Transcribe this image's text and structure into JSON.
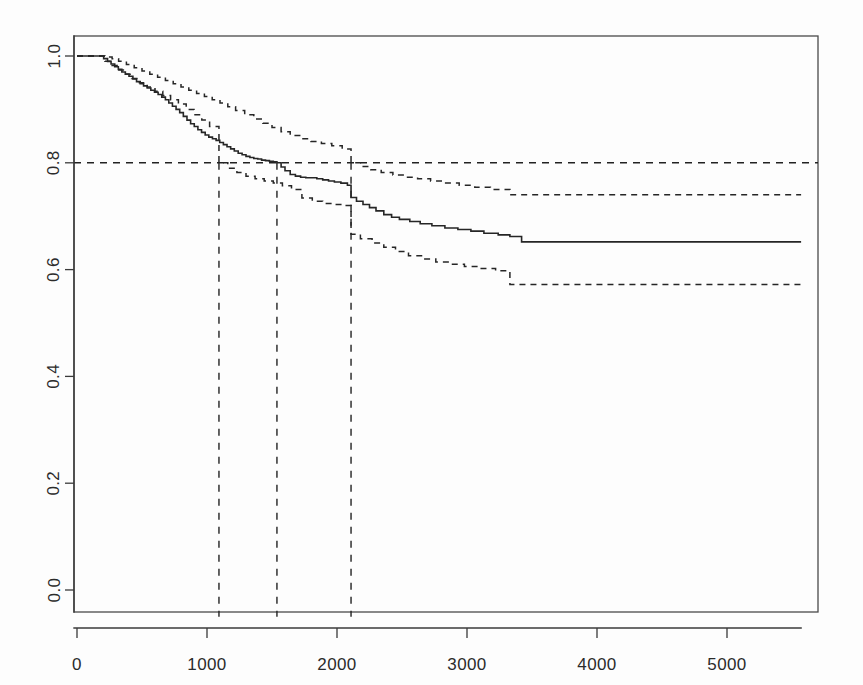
{
  "figure": {
    "kind": "kaplan-meier-survival-plot",
    "background_color": "#fdfdfd",
    "ink_color": "#262626"
  },
  "chart_data": {
    "type": "line",
    "title": "",
    "subtitle": "",
    "xlabel": "",
    "ylabel": "",
    "xlim": [
      -140,
      5720
    ],
    "ylim": [
      -0.05,
      1.05
    ],
    "grid": false,
    "legend": null,
    "xticks": [
      0,
      1000,
      2000,
      3000,
      4000,
      5000
    ],
    "xtick_labels": [
      "0",
      "1000",
      "2000",
      "3000",
      "4000",
      "5000"
    ],
    "yticks": [
      0.0,
      0.2,
      0.4,
      0.6,
      0.8,
      1.0
    ],
    "ytick_labels": [
      "0.0",
      "0.2",
      "0.4",
      "0.6",
      "0.8",
      "1.0"
    ],
    "ytick_label_rotation": -90,
    "annotations": [
      {
        "name": "reference-survival-level",
        "type": "hline",
        "y": 0.8,
        "style": "dashed"
      },
      {
        "name": "lower-ci-crosses-0.8",
        "type": "vline",
        "x": 1092,
        "style": "dashed",
        "from_y": -0.05,
        "to_y": 0.8
      },
      {
        "name": "estimate-crosses-0.8",
        "type": "vline",
        "x": 1538,
        "style": "dashed",
        "from_y": -0.05,
        "to_y": 0.8
      },
      {
        "name": "upper-ci-crosses-0.8",
        "type": "vline",
        "x": 2108,
        "style": "dashed",
        "from_y": -0.05,
        "to_y": 0.8
      }
    ],
    "series": [
      {
        "name": "Survival estimate",
        "style": "solid",
        "step": "post",
        "x": [
          0,
          175,
          205,
          235,
          262,
          290,
          318,
          345,
          372,
          400,
          430,
          458,
          486,
          512,
          540,
          568,
          596,
          624,
          652,
          680,
          706,
          734,
          762,
          790,
          818,
          846,
          874,
          902,
          930,
          958,
          986,
          1014,
          1042,
          1070,
          1098,
          1126,
          1154,
          1182,
          1210,
          1240,
          1270,
          1300,
          1330,
          1360,
          1390,
          1420,
          1450,
          1480,
          1510,
          1538,
          1570,
          1600,
          1640,
          1680,
          1720,
          1760,
          1800,
          1845,
          1890,
          1935,
          1980,
          2030,
          2080,
          2108,
          2150,
          2200,
          2250,
          2300,
          2360,
          2420,
          2480,
          2560,
          2640,
          2730,
          2830,
          2930,
          3030,
          3130,
          3240,
          3330,
          3420,
          5570
        ],
        "y": [
          1.0,
          1.0,
          0.995,
          0.99,
          0.985,
          0.98,
          0.975,
          0.97,
          0.966,
          0.962,
          0.957,
          0.952,
          0.948,
          0.944,
          0.94,
          0.936,
          0.932,
          0.928,
          0.923,
          0.918,
          0.912,
          0.906,
          0.9,
          0.894,
          0.887,
          0.88,
          0.873,
          0.868,
          0.862,
          0.857,
          0.852,
          0.848,
          0.845,
          0.842,
          0.838,
          0.834,
          0.83,
          0.826,
          0.822,
          0.818,
          0.815,
          0.812,
          0.81,
          0.808,
          0.807,
          0.805,
          0.804,
          0.803,
          0.802,
          0.8,
          0.792,
          0.785,
          0.778,
          0.775,
          0.773,
          0.772,
          0.772,
          0.77,
          0.768,
          0.766,
          0.764,
          0.762,
          0.758,
          0.735,
          0.728,
          0.722,
          0.716,
          0.71,
          0.703,
          0.698,
          0.694,
          0.69,
          0.686,
          0.682,
          0.678,
          0.675,
          0.672,
          0.668,
          0.665,
          0.662,
          0.652,
          0.652
        ]
      },
      {
        "name": "Upper 95% confidence limit",
        "style": "dashed",
        "step": "post",
        "x": [
          0,
          175,
          220,
          270,
          320,
          380,
          440,
          500,
          560,
          620,
          680,
          740,
          800,
          860,
          920,
          980,
          1040,
          1100,
          1160,
          1220,
          1290,
          1360,
          1430,
          1500,
          1570,
          1640,
          1720,
          1800,
          1880,
          1960,
          2040,
          2108,
          2180,
          2260,
          2340,
          2430,
          2520,
          2620,
          2720,
          2830,
          2940,
          3060,
          3180,
          3330,
          3420,
          5570
        ],
        "y": [
          1.0,
          1.0,
          0.998,
          0.995,
          0.99,
          0.984,
          0.978,
          0.972,
          0.966,
          0.96,
          0.954,
          0.948,
          0.942,
          0.936,
          0.93,
          0.924,
          0.918,
          0.912,
          0.905,
          0.898,
          0.89,
          0.882,
          0.874,
          0.866,
          0.858,
          0.851,
          0.845,
          0.84,
          0.836,
          0.832,
          0.826,
          0.8,
          0.793,
          0.787,
          0.782,
          0.777,
          0.773,
          0.77,
          0.766,
          0.762,
          0.758,
          0.754,
          0.75,
          0.74,
          0.74,
          0.74
        ]
      },
      {
        "name": "Lower 95% confidence limit",
        "style": "dashed",
        "step": "post",
        "x": [
          0,
          175,
          215,
          260,
          310,
          365,
          420,
          480,
          540,
          600,
          660,
          720,
          780,
          840,
          900,
          960,
          1020,
          1092,
          1160,
          1230,
          1300,
          1370,
          1440,
          1510,
          1580,
          1650,
          1730,
          1810,
          1890,
          1970,
          2050,
          2108,
          2180,
          2270,
          2360,
          2450,
          2550,
          2650,
          2760,
          2870,
          2980,
          3100,
          3220,
          3330,
          3420,
          5570
        ],
        "y": [
          1.0,
          1.0,
          0.99,
          0.982,
          0.974,
          0.966,
          0.958,
          0.95,
          0.942,
          0.934,
          0.926,
          0.918,
          0.91,
          0.9,
          0.89,
          0.88,
          0.868,
          0.8,
          0.79,
          0.782,
          0.775,
          0.77,
          0.766,
          0.762,
          0.757,
          0.75,
          0.734,
          0.728,
          0.724,
          0.722,
          0.72,
          0.666,
          0.658,
          0.65,
          0.642,
          0.634,
          0.626,
          0.62,
          0.614,
          0.61,
          0.606,
          0.602,
          0.598,
          0.572,
          0.572,
          0.572
        ]
      }
    ]
  }
}
